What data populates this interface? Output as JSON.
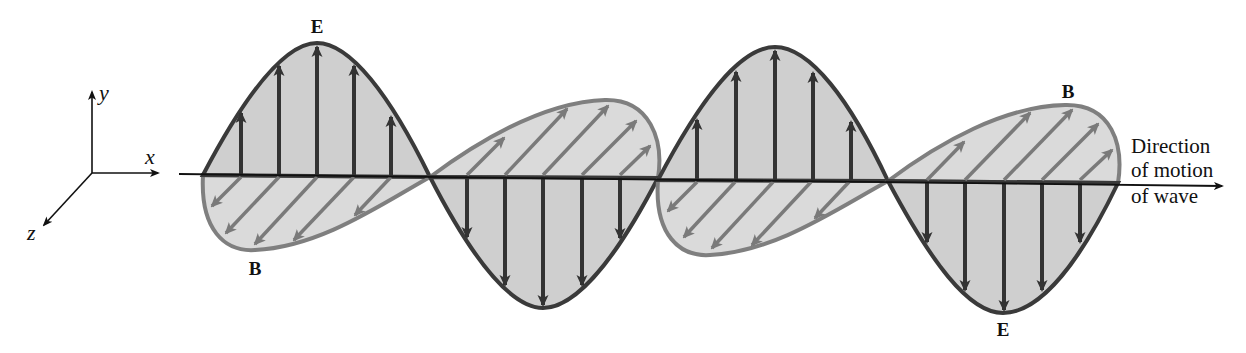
{
  "diagram": {
    "type": "electromagnetic-wave",
    "axes": {
      "x_label": "x",
      "y_label": "y",
      "z_label": "z"
    },
    "labels": {
      "e_top": "E",
      "b_bottom": "B",
      "b_top": "B",
      "e_bottom": "E"
    },
    "direction_label": [
      "Direction",
      "of motion",
      "of wave"
    ],
    "colors": {
      "background": "#ffffff",
      "e_field_outline": "#3a3a3a",
      "e_field_fill": "#cfcfcf",
      "e_arrow": "#333333",
      "b_field_outline": "#7f7f7f",
      "b_field_fill": "#dadada",
      "b_arrow": "#7a7a7a",
      "axis": "#111111"
    }
  }
}
